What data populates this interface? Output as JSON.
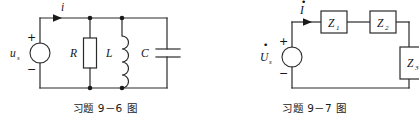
{
  "figure_sheet": {
    "background_color": "#ffffff",
    "line_color": "#2a2a2a",
    "text_color": "#141414"
  },
  "figures": {
    "left": {
      "caption": "习题 9－6 图",
      "source": {
        "type": "ac-voltage-source-circle",
        "label_main": "u",
        "label_sub": "s",
        "plus_sign": "+",
        "minus_sign": "−"
      },
      "current": {
        "label": "i",
        "direction": "right"
      },
      "components": [
        {
          "name": "resistor",
          "label": "R",
          "symbol": "rectangle-box"
        },
        {
          "name": "inductor",
          "label": "L",
          "symbol": "coil-four-arcs"
        },
        {
          "name": "capacitor",
          "label": "C",
          "symbol": "parallel-plates"
        }
      ],
      "topology": "source in parallel with R, L and C branches"
    },
    "right": {
      "caption": "习题 9－7 图",
      "source": {
        "type": "ac-voltage-source-circle",
        "label_main": "U",
        "label_sub": "s",
        "label_dot": "̇",
        "plus_sign": "+",
        "minus_sign": "−"
      },
      "current": {
        "label": "I",
        "label_dot": "̇",
        "direction": "right"
      },
      "components": [
        {
          "name": "impedance-1",
          "label": "Z",
          "label_sub": "1",
          "symbol": "rectangle-box"
        },
        {
          "name": "impedance-2",
          "label": "Z",
          "label_sub": "2",
          "symbol": "rectangle-box"
        },
        {
          "name": "impedance-3",
          "label": "Z",
          "label_sub": "3",
          "symbol": "rectangle-box-clipped"
        }
      ],
      "topology": "series loop: source, Z1, Z2, then Z3 on the right branch (clipped at image edge)"
    }
  }
}
